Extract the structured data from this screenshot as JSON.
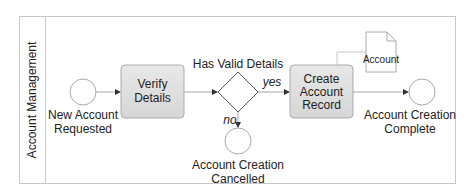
{
  "pool": {
    "lane_label": "Account Management"
  },
  "nodes": {
    "start": {
      "label_line1": "New Account",
      "label_line2": "Requested"
    },
    "verify": {
      "label_line1": "Verify",
      "label_line2": "Details"
    },
    "gateway": {
      "label": "Has Valid Details"
    },
    "create": {
      "label_line1": "Create",
      "label_line2": "Account",
      "label_line3": "Record"
    },
    "document": {
      "label": "Account"
    },
    "end_complete": {
      "label_line1": "Account Creation",
      "label_line2": "Complete"
    },
    "end_cancelled": {
      "label_line1": "Account Creation",
      "label_line2": "Cancelled"
    }
  },
  "edges": {
    "yes_label": "yes",
    "no_label": "no"
  },
  "colors": {
    "task_fill": "#e0e0e0",
    "stroke": "#8c8c8c",
    "frame": "#c8c8c8"
  }
}
